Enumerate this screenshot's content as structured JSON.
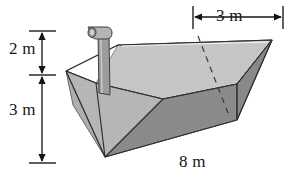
{
  "figure": {
    "background_color": "#ffffff",
    "line_color": "#2b2b2b",
    "labels": {
      "height_upper": "2 m",
      "height_lower": "3 m",
      "top_width": "3 m",
      "length": "8 m"
    },
    "watermark": "",
    "colors": {
      "face_front_dark": "#8e8e8e",
      "face_left_mid": "#a9a9a9",
      "face_inside_light": "#c3c3c3",
      "face_rim_top": "#bdbdbd",
      "face_far_light": "#cccccc",
      "pipe_body": "#9a9a9a",
      "pipe_cap": "#b6b6b6",
      "outline": "#3a3a3a",
      "dimension": "#1a1a1a"
    },
    "geometry": {
      "note": "3-D oblique view of an open trapezoidal trough, 8 m long, 3 m wide at the top, 3 m deep, with a 2 m standpipe rising above the rim",
      "top_front_left": [
        66,
        71
      ],
      "top_back_left": [
        118,
        45
      ],
      "top_back_right": [
        272,
        40
      ],
      "top_front_right": [
        237,
        84
      ],
      "bottom_front": [
        105,
        157
      ],
      "bottom_back_right": [
        237,
        120
      ],
      "hidden_edge_start": [
        198,
        36
      ],
      "hidden_edge_end": [
        228,
        113
      ]
    },
    "dimension_lines": {
      "vertical_upper": {
        "x": 42,
        "y_top": 31,
        "y_bottom": 75,
        "ticks": [
          "arrow-up",
          "arrow-down"
        ]
      },
      "vertical_lower": {
        "x": 42,
        "y_top": 75,
        "y_bottom": 163,
        "ticks": [
          "arrow-up",
          "arrow-down"
        ]
      },
      "horizontal_top": {
        "y": 17,
        "x_left": 193,
        "x_right": 283,
        "ticks": [
          "arrow-left",
          "arrow-right"
        ]
      }
    }
  }
}
